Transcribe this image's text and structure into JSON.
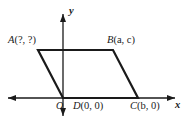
{
  "figure": {
    "background_color": "#ffffff",
    "stroke_color": "#1a1a1a",
    "axis_color": "#1a1a1a"
  },
  "axes": {
    "x_label": "x",
    "y_label": "y",
    "origin_label": "O",
    "x_axis": {
      "x1": 8,
      "y1": 98,
      "x2": 175,
      "y2": 98,
      "arrows": "both"
    },
    "y_axis": {
      "x1": 63,
      "y1": 14,
      "x2": 63,
      "y2": 116,
      "arrows": "both"
    }
  },
  "vertices": [
    {
      "id": "A",
      "name": "A",
      "coords": "(?, ?)",
      "label": "A(?, ?)",
      "px": 38,
      "py": 50
    },
    {
      "id": "B",
      "name": "B",
      "coords": "(a, c)",
      "label": "B(a, c)",
      "px": 113,
      "py": 50
    },
    {
      "id": "C",
      "name": "C",
      "coords": "(b, 0)",
      "label": "C(b, 0)",
      "px": 138,
      "py": 98
    },
    {
      "id": "D",
      "name": "D",
      "coords": "(0, 0)",
      "label": "D(0, 0)",
      "px": 63,
      "py": 98
    }
  ],
  "shape": {
    "type": "parallelogram",
    "points": "38,50 113,50 138,98 63,98",
    "stroke_width": 2.2
  }
}
